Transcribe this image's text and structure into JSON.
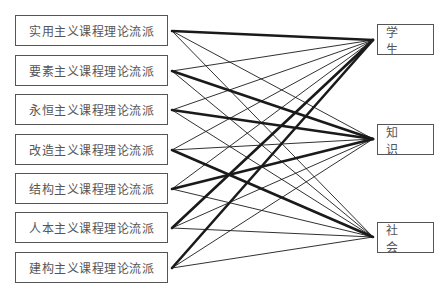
{
  "diagram": {
    "type": "bipartite-link-diagram",
    "left_nodes": [
      {
        "id": "L0",
        "label": "实用主义课程理论流派",
        "y": 31
      },
      {
        "id": "L1",
        "label": "要素主义课程理论流派",
        "y": 71
      },
      {
        "id": "L2",
        "label": "永恒主义课程理论流派",
        "y": 110
      },
      {
        "id": "L3",
        "label": "改造主义课程理论流派",
        "y": 150
      },
      {
        "id": "L4",
        "label": "结构主义课程理论流派",
        "y": 189
      },
      {
        "id": "L5",
        "label": "人本主义课程理论流派",
        "y": 228
      },
      {
        "id": "L6",
        "label": "建构主义课程理论流派",
        "y": 268
      }
    ],
    "right_nodes": [
      {
        "id": "R0",
        "label": "学 生",
        "y": 40
      },
      {
        "id": "R1",
        "label": "知 识",
        "y": 139
      },
      {
        "id": "R2",
        "label": "社 会",
        "y": 237
      }
    ],
    "links": [
      {
        "from": 0,
        "to": 0,
        "weight": "thick"
      },
      {
        "from": 0,
        "to": 1,
        "weight": "thin"
      },
      {
        "from": 0,
        "to": 2,
        "weight": "thin"
      },
      {
        "from": 1,
        "to": 0,
        "weight": "thin"
      },
      {
        "from": 1,
        "to": 1,
        "weight": "thick"
      },
      {
        "from": 1,
        "to": 2,
        "weight": "thin"
      },
      {
        "from": 2,
        "to": 0,
        "weight": "thin"
      },
      {
        "from": 2,
        "to": 1,
        "weight": "thick"
      },
      {
        "from": 2,
        "to": 2,
        "weight": "thin"
      },
      {
        "from": 3,
        "to": 0,
        "weight": "thin"
      },
      {
        "from": 3,
        "to": 1,
        "weight": "thin"
      },
      {
        "from": 3,
        "to": 2,
        "weight": "thick"
      },
      {
        "from": 4,
        "to": 0,
        "weight": "thin"
      },
      {
        "from": 4,
        "to": 1,
        "weight": "thick"
      },
      {
        "from": 4,
        "to": 2,
        "weight": "thin"
      },
      {
        "from": 5,
        "to": 0,
        "weight": "thick"
      },
      {
        "from": 5,
        "to": 1,
        "weight": "thin"
      },
      {
        "from": 5,
        "to": 2,
        "weight": "thin"
      },
      {
        "from": 6,
        "to": 0,
        "weight": "thick"
      },
      {
        "from": 6,
        "to": 1,
        "weight": "thin"
      },
      {
        "from": 6,
        "to": 2,
        "weight": "thin"
      }
    ],
    "colors": {
      "line": "#1a1a1a",
      "border": "#555555",
      "text": "#555555"
    }
  }
}
